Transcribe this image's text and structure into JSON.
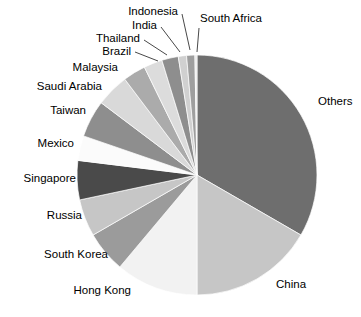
{
  "chart_data": {
    "type": "pie",
    "title": "",
    "subtitle": "",
    "xlabel": "",
    "ylabel": "",
    "legend_position": "labels-with-leader-lines",
    "grid": false,
    "center": {
      "x": 197,
      "y": 175
    },
    "radius": 120,
    "start_angle_deg": 0,
    "direction": "clockwise",
    "categories": [
      "Others",
      "China",
      "Hong Kong",
      "South Korea",
      "Russia",
      "Singapore",
      "Mexico",
      "Taiwan",
      "Saudi Arabia",
      "Malaysia",
      "Brazil",
      "Thailand",
      "India",
      "Indonesia",
      "South Africa"
    ],
    "values": [
      33.3,
      16.7,
      11.1,
      5.6,
      5.0,
      5.3,
      3.3,
      5.0,
      4.4,
      3.1,
      2.5,
      2.2,
      1.1,
      1.1,
      0.3
    ],
    "slices": [
      {
        "label": "Others",
        "value": 33.3,
        "start_deg": 0.0,
        "end_deg": 120.0,
        "color": "#6e6e6e"
      },
      {
        "label": "China",
        "value": 16.7,
        "start_deg": 120.0,
        "end_deg": 180.0,
        "color": "#c6c6c6"
      },
      {
        "label": "Hong Kong",
        "value": 11.1,
        "start_deg": 180.0,
        "end_deg": 220.0,
        "color": "#f2f2f2"
      },
      {
        "label": "South Korea",
        "value": 5.6,
        "start_deg": 220.0,
        "end_deg": 240.0,
        "color": "#9b9b9b"
      },
      {
        "label": "Russia",
        "value": 5.0,
        "start_deg": 240.0,
        "end_deg": 258.0,
        "color": "#c6c6c6"
      },
      {
        "label": "Singapore",
        "value": 5.3,
        "start_deg": 258.0,
        "end_deg": 277.0,
        "color": "#4a4a4a"
      },
      {
        "label": "Mexico",
        "value": 3.3,
        "start_deg": 277.0,
        "end_deg": 289.0,
        "color": "#fbfbfb"
      },
      {
        "label": "Taiwan",
        "value": 5.0,
        "start_deg": 289.0,
        "end_deg": 307.0,
        "color": "#8e8e8e"
      },
      {
        "label": "Saudi Arabia",
        "value": 4.4,
        "start_deg": 307.0,
        "end_deg": 323.0,
        "color": "#d9d9d9"
      },
      {
        "label": "Malaysia",
        "value": 3.1,
        "start_deg": 323.0,
        "end_deg": 334.0,
        "color": "#ababab"
      },
      {
        "label": "Brazil",
        "value": 2.5,
        "start_deg": 334.0,
        "end_deg": 343.0,
        "color": "#dcdcdc"
      },
      {
        "label": "Thailand",
        "value": 2.2,
        "start_deg": 343.0,
        "end_deg": 351.0,
        "color": "#8e8e8e"
      },
      {
        "label": "India",
        "value": 1.1,
        "start_deg": 351.0,
        "end_deg": 355.0,
        "color": "#d0d0d0"
      },
      {
        "label": "Indonesia",
        "value": 1.1,
        "start_deg": 355.0,
        "end_deg": 359.0,
        "color": "#9e9e9e"
      },
      {
        "label": "South Africa",
        "value": 0.3,
        "start_deg": 359.0,
        "end_deg": 360.0,
        "color": "#e6e6e6"
      }
    ],
    "labels": [
      {
        "text": "Others",
        "x": 318,
        "y": 101,
        "align": "left",
        "leader": null
      },
      {
        "text": "China",
        "x": 276,
        "y": 284,
        "align": "left",
        "leader": null
      },
      {
        "text": "Hong Kong",
        "x": 131,
        "y": 290,
        "align": "right",
        "leader": null
      },
      {
        "text": "South Korea",
        "x": 108,
        "y": 254,
        "align": "right",
        "leader": null
      },
      {
        "text": "Russia",
        "x": 82,
        "y": 215,
        "align": "right",
        "leader": null
      },
      {
        "text": "Singapore",
        "x": 76,
        "y": 178,
        "align": "right",
        "leader": null
      },
      {
        "text": "Mexico",
        "x": 74,
        "y": 143,
        "align": "right",
        "leader": null
      },
      {
        "text": "Taiwan",
        "x": 86,
        "y": 110,
        "align": "right",
        "leader": null
      },
      {
        "text": "Saudi Arabia",
        "x": 102,
        "y": 86,
        "align": "right",
        "leader": null
      },
      {
        "text": "Malaysia",
        "x": 118,
        "y": 67,
        "align": "right",
        "leader": null
      },
      {
        "text": "Brazil",
        "x": 131,
        "y": 51,
        "align": "right",
        "leader": [
          135,
          52,
          158,
          61
        ]
      },
      {
        "text": "Thailand",
        "x": 140,
        "y": 38,
        "align": "right",
        "leader": [
          144,
          40,
          167,
          55
        ]
      },
      {
        "text": "India",
        "x": 157,
        "y": 25,
        "align": "right",
        "leader": [
          161,
          27,
          180,
          52
        ]
      },
      {
        "text": "Indonesia",
        "x": 178,
        "y": 11,
        "align": "right",
        "leader": [
          182,
          14,
          190,
          50
        ]
      },
      {
        "text": "South Africa",
        "x": 200,
        "y": 18,
        "align": "left",
        "leader": [
          199,
          28,
          197,
          52
        ]
      }
    ]
  }
}
